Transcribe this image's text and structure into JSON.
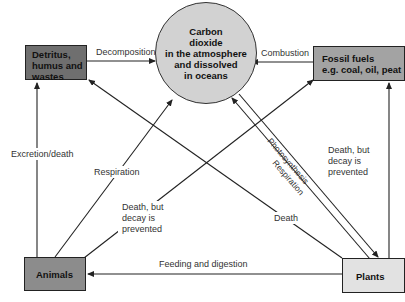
{
  "nodes": {
    "co2": {
      "line1": "Carbon",
      "line2": "dioxide",
      "line3": "in the atmosphere",
      "line4": "and dissolved",
      "line5": "in oceans",
      "color": "#d2d2d2"
    },
    "detritus": {
      "line1": "Detritus,",
      "line2": "humus and",
      "line3": "wastes",
      "color": "#6f6f6f"
    },
    "fossil": {
      "line1": "Fossil fuels",
      "line2": "e.g. coal, oil, peat",
      "color": "#a3a3a3"
    },
    "animals": {
      "label": "Animals",
      "color": "#8c8c8c"
    },
    "plants": {
      "label": "Plants",
      "color": "#e2e2e2"
    }
  },
  "edges": {
    "decomposition": "Decomposition",
    "combustion": "Combustion",
    "excretion": "Excretion/death",
    "respiration_animals": "Respiration",
    "death_decay_animals": {
      "line1": "Death, but",
      "line2": "decay is",
      "line3": "prevented"
    },
    "death_decay_plants": {
      "line1": "Death, but",
      "line2": "decay is",
      "line3": "prevented"
    },
    "photosynthesis": "Photosynthesis",
    "respiration_plants": "Respiration",
    "death_plants": "Death",
    "feeding": "Feeding and digestion"
  }
}
